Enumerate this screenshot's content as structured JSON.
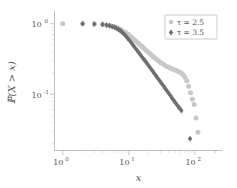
{
  "figure": {
    "background_color": "#ffffff",
    "frame_color": "#b9b9b9"
  },
  "chart_data": {
    "type": "scatter",
    "title": "",
    "xlabel": "x",
    "ylabel": "ℙ(X > x)",
    "xscale": "log",
    "yscale": "log",
    "xlim": [
      0.75,
      260
    ],
    "ylim": [
      0.016,
      1.35
    ],
    "grid": false,
    "xticks": [
      1,
      10,
      100
    ],
    "xtick_labels": [
      "10⁰",
      "10¹",
      "10²"
    ],
    "xtick_mantissa": [
      "10",
      "10",
      "10"
    ],
    "xtick_exponent": [
      "0",
      "1",
      "2"
    ],
    "yticks": [
      1,
      0.1
    ],
    "ytick_labels": [
      "10⁰",
      "10⁻¹"
    ],
    "ytick_mantissa": [
      "10",
      "10"
    ],
    "ytick_exponent": [
      "0",
      "-1"
    ],
    "legend": {
      "position": "upper-right",
      "entries": [
        {
          "label": "τ = 2.5",
          "marker": "circle",
          "color": "#c8c8c8"
        },
        {
          "label": "τ = 3.5",
          "marker": "diamond",
          "color": "#6e6e6e"
        }
      ]
    },
    "series": [
      {
        "name": "τ = 2.5",
        "label": "τ = 2.5",
        "color": "#c8c8c8",
        "marker": "circle",
        "x": [
          1,
          2,
          3,
          4,
          4.6,
          5.2,
          5.8,
          6.3,
          6.8,
          7.3,
          7.8,
          8.3,
          8.9,
          9.4,
          10,
          10.7,
          11.4,
          12.2,
          13,
          13.9,
          14.8,
          15.8,
          16.9,
          18,
          19.2,
          20.5,
          21.9,
          23.3,
          24.9,
          26.6,
          28.4,
          30.3,
          32.3,
          34.5,
          36.8,
          39.3,
          41.9,
          44.7,
          47.7,
          50.9,
          54.3,
          57.9,
          61.8,
          65.9,
          70.3,
          75,
          80,
          85.3,
          91,
          97,
          103.5,
          110.4
        ],
        "y": [
          1.0,
          1.0,
          0.99,
          0.98,
          0.96,
          0.94,
          0.92,
          0.895,
          0.87,
          0.84,
          0.81,
          0.78,
          0.75,
          0.72,
          0.69,
          0.655,
          0.62,
          0.59,
          0.56,
          0.53,
          0.5,
          0.475,
          0.45,
          0.425,
          0.4,
          0.38,
          0.36,
          0.34,
          0.325,
          0.31,
          0.295,
          0.28,
          0.27,
          0.26,
          0.25,
          0.243,
          0.236,
          0.23,
          0.224,
          0.219,
          0.213,
          0.207,
          0.2,
          0.19,
          0.175,
          0.155,
          0.13,
          0.105,
          0.085,
          0.072,
          0.046,
          0.029
        ]
      },
      {
        "name": "τ = 3.5",
        "label": "τ = 3.5",
        "color": "#6e6e6e",
        "marker": "diamond",
        "x": [
          2,
          3,
          4,
          4.6,
          5.1,
          5.6,
          6.1,
          6.5,
          6.9,
          7.3,
          7.7,
          8.1,
          8.6,
          9.1,
          9.6,
          10.2,
          10.8,
          11.5,
          12.2,
          13,
          13.8,
          14.7,
          15.6,
          16.6,
          17.7,
          18.8,
          20,
          21.3,
          22.7,
          24.1,
          25.7,
          27.3,
          29.1,
          31,
          33,
          35.1,
          37.4,
          39.8,
          42.4,
          45.1,
          48,
          51.1,
          54.4,
          57.9,
          62,
          84
        ],
        "y": [
          1.0,
          0.99,
          0.975,
          0.955,
          0.935,
          0.91,
          0.885,
          0.86,
          0.835,
          0.805,
          0.775,
          0.74,
          0.7,
          0.66,
          0.62,
          0.58,
          0.54,
          0.5,
          0.465,
          0.43,
          0.4,
          0.37,
          0.343,
          0.318,
          0.295,
          0.273,
          0.252,
          0.233,
          0.215,
          0.198,
          0.183,
          0.169,
          0.156,
          0.144,
          0.133,
          0.122,
          0.113,
          0.104,
          0.096,
          0.088,
          0.081,
          0.075,
          0.069,
          0.064,
          0.059,
          0.0235
        ]
      }
    ]
  }
}
